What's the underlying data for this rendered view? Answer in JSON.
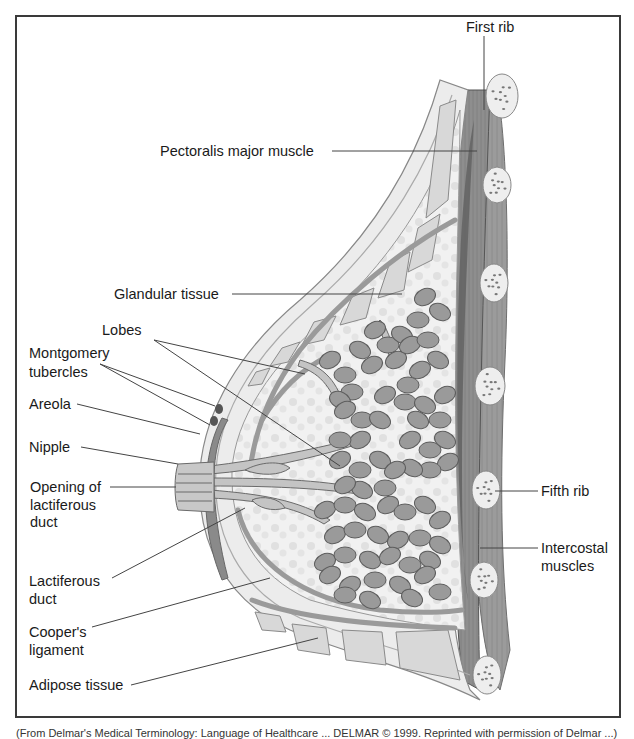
{
  "figure": {
    "labels": {
      "first_rib": "First rib",
      "pectoralis_major": "Pectoralis major muscle",
      "glandular_tissue": "Glandular tissue",
      "lobes": "Lobes",
      "montgomery_1": "Montgomery",
      "montgomery_2": "tubercles",
      "areola": "Areola",
      "nipple": "Nipple",
      "opening_1": "Opening of",
      "opening_2": "lactiferous",
      "opening_3": "duct",
      "lactiferous_1": "Lactiferous",
      "lactiferous_2": "duct",
      "coopers_1": "Cooper's",
      "coopers_2": "ligament",
      "adipose": "Adipose tissue",
      "fifth_rib": "Fifth rib",
      "intercostal_1": "Intercostal",
      "intercostal_2": "muscles"
    },
    "caption": "(From Delmar's Medical Terminology: Language of Healthcare ... DELMAR © 1999. Reprinted with permission of Delmar ...)"
  },
  "colors": {
    "skin": "#e6e6e6",
    "fat": "#d4d4d4",
    "lobe": "#9a9a9a",
    "muscle": "#8c8c8c",
    "muscle_dark": "#6f6f6f",
    "rib": "#eeeeee",
    "text": "#1a1a1a"
  }
}
